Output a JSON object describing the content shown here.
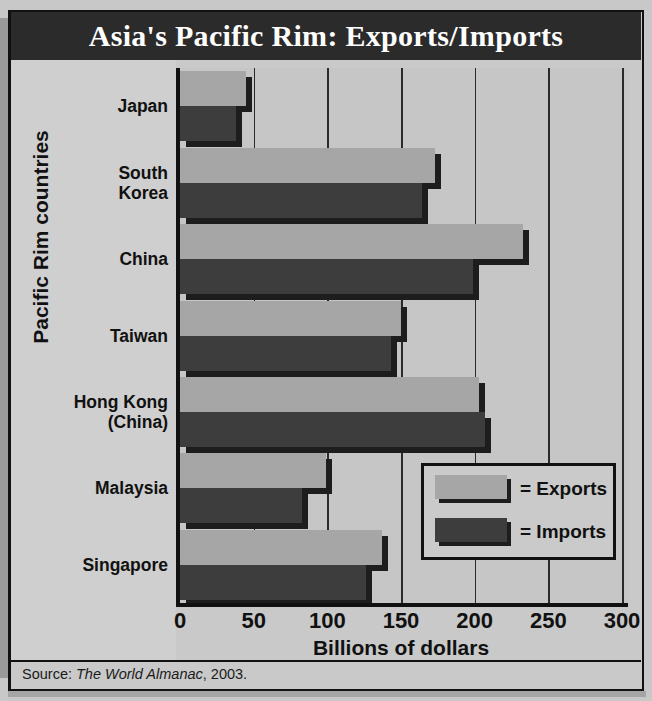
{
  "title": "Asia's Pacific Rim: Exports/Imports",
  "axis": {
    "ylabel": "Pacific Rim countries",
    "xlabel": "Billions of dollars",
    "xticks": [
      "0",
      "50",
      "100",
      "150",
      "200",
      "250",
      "300"
    ]
  },
  "legend": {
    "exports": "= Exports",
    "imports": "= Imports"
  },
  "source": {
    "prefix": "Source: ",
    "publication": "The World Almanac",
    "suffix": ", 2003."
  },
  "colors": {
    "exports": "#a6a6a6",
    "imports": "#3d3d3d",
    "shadow": "#1d1d1d",
    "banner": "#2b2b2b",
    "background": "#c9c9c9",
    "axis": "#111111"
  },
  "chart_data": {
    "type": "bar",
    "orientation": "horizontal",
    "title": "Asia's Pacific Rim: Exports/Imports",
    "xlabel": "Billions of dollars",
    "ylabel": "Pacific Rim countries",
    "xlim": [
      0,
      300
    ],
    "xticks": [
      0,
      50,
      100,
      150,
      200,
      250,
      300
    ],
    "grid": true,
    "legend_position": "inside-lower-right",
    "categories": [
      "Japan",
      "South Korea",
      "China",
      "Taiwan",
      "Hong Kong (China)",
      "Malaysia",
      "Singapore"
    ],
    "series": [
      {
        "name": "Exports",
        "values": [
          45,
          173,
          233,
          150,
          203,
          99,
          137
        ]
      },
      {
        "name": "Imports",
        "values": [
          38,
          164,
          199,
          143,
          207,
          83,
          126
        ]
      }
    ]
  }
}
